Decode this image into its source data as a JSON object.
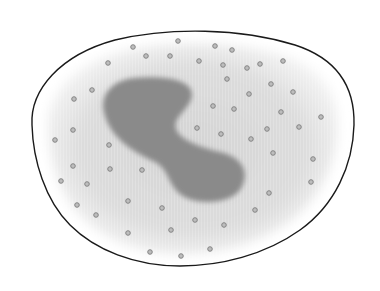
{
  "diagram": {
    "colors": {
      "background": "#ffffff",
      "membrane_stroke": "#1a1a1a",
      "cytoplasm_center": "#d4d4d4",
      "cytoplasm_edge": "#f4f4f4",
      "nucleus": "#8a8a8a",
      "granule_stroke": "#7d7d7d",
      "granule_fill": "#bdbdbd"
    },
    "membrane": {
      "path": "M 32 125 C 30 90 60 55 115 40 C 170 27 240 28 295 45 C 335 58 355 85 354 125 C 353 165 335 205 300 230 C 265 255 220 266 180 266 C 135 266 95 250 70 225 C 45 200 33 160 32 125 Z"
    },
    "nucleus": {
      "path": "M 104 112 C 100 95 112 80 135 78 C 158 76 185 78 191 90 C 196 102 180 112 176 122 C 172 135 190 145 220 152 C 245 158 250 175 240 190 C 230 203 200 206 183 196 C 168 187 170 170 155 162 C 138 154 110 140 104 112 Z"
    },
    "granules": [
      [
        133,
        47
      ],
      [
        178,
        41
      ],
      [
        215,
        46
      ],
      [
        232,
        50
      ],
      [
        108,
        63
      ],
      [
        146,
        56
      ],
      [
        170,
        56
      ],
      [
        199,
        61
      ],
      [
        223,
        65
      ],
      [
        247,
        68
      ],
      [
        260,
        64
      ],
      [
        283,
        61
      ],
      [
        227,
        79
      ],
      [
        92,
        90
      ],
      [
        74,
        99
      ],
      [
        271,
        84
      ],
      [
        249,
        94
      ],
      [
        293,
        92
      ],
      [
        213,
        106
      ],
      [
        234,
        109
      ],
      [
        281,
        112
      ],
      [
        321,
        117
      ],
      [
        73,
        130
      ],
      [
        55,
        140
      ],
      [
        197,
        128
      ],
      [
        221,
        134
      ],
      [
        267,
        129
      ],
      [
        299,
        127
      ],
      [
        251,
        139
      ],
      [
        109,
        145
      ],
      [
        273,
        153
      ],
      [
        73,
        166
      ],
      [
        110,
        169
      ],
      [
        142,
        170
      ],
      [
        313,
        159
      ],
      [
        61,
        181
      ],
      [
        87,
        184
      ],
      [
        311,
        182
      ],
      [
        269,
        193
      ],
      [
        77,
        205
      ],
      [
        128,
        201
      ],
      [
        162,
        208
      ],
      [
        255,
        210
      ],
      [
        96,
        215
      ],
      [
        195,
        220
      ],
      [
        224,
        225
      ],
      [
        171,
        230
      ],
      [
        128,
        233
      ],
      [
        210,
        249
      ],
      [
        150,
        252
      ],
      [
        181,
        256
      ]
    ],
    "granule_radius": 2.3
  }
}
